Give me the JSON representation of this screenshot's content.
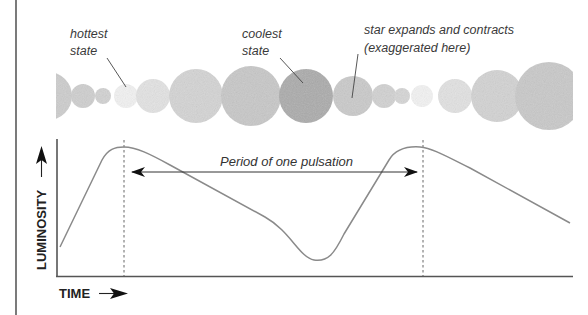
{
  "annotations": {
    "hottest": {
      "line1": "hottest",
      "line2": "state"
    },
    "coolest": {
      "line1": "coolest",
      "line2": "state"
    },
    "expands": {
      "line1": "star expands and contracts",
      "line2": "(exaggerated here)"
    }
  },
  "axes": {
    "y_label": "LUMINOSITY",
    "x_label": "TIME"
  },
  "period_label": "Period of one pulsation",
  "colors": {
    "curve": "#8a8a8a",
    "axis": "#555555",
    "arrow": "#111111",
    "frame": "#222222",
    "star_light": "#e6e6e6",
    "star_mid": "#c9c9c9",
    "star_dark": "#a8a8a8"
  },
  "stars": [
    {
      "cx": 48,
      "cy": 96,
      "r": 24,
      "shade": "#cdcdcd"
    },
    {
      "cx": 83,
      "cy": 96,
      "r": 12,
      "shade": "#cfcfcf"
    },
    {
      "cx": 103,
      "cy": 96,
      "r": 8,
      "shade": "#d2d2d2"
    },
    {
      "cx": 126,
      "cy": 96,
      "r": 12,
      "shade": "#f2f2f2"
    },
    {
      "cx": 153,
      "cy": 96,
      "r": 17,
      "shade": "#e3e3e3"
    },
    {
      "cx": 196,
      "cy": 96,
      "r": 27,
      "shade": "#d4d4d4"
    },
    {
      "cx": 251,
      "cy": 96,
      "r": 30,
      "shade": "#c8c8c8"
    },
    {
      "cx": 306,
      "cy": 96,
      "r": 27,
      "shade": "#ababab"
    },
    {
      "cx": 353,
      "cy": 96,
      "r": 20,
      "shade": "#cacaca"
    },
    {
      "cx": 384,
      "cy": 96,
      "r": 12,
      "shade": "#d2d2d2"
    },
    {
      "cx": 402,
      "cy": 96,
      "r": 8,
      "shade": "#d6d6d6"
    },
    {
      "cx": 422,
      "cy": 96,
      "r": 11,
      "shade": "#f3f3f3"
    },
    {
      "cx": 455,
      "cy": 96,
      "r": 17,
      "shade": "#e2e2e2"
    },
    {
      "cx": 497,
      "cy": 96,
      "r": 26,
      "shade": "#d3d3d3"
    },
    {
      "cx": 549,
      "cy": 96,
      "r": 34,
      "shade": "#c9c9c9"
    }
  ],
  "chart_data": {
    "type": "line",
    "xlabel": "TIME",
    "ylabel": "LUMINOSITY",
    "x_ticks": [],
    "y_ticks": [],
    "grid": false,
    "legend": null,
    "series": [
      {
        "name": "luminosity",
        "points_px": [
          [
            60,
            247
          ],
          [
            100,
            168
          ],
          [
            110,
            152
          ],
          [
            123,
            147
          ],
          [
            140,
            150
          ],
          [
            170,
            165
          ],
          [
            265,
            216
          ],
          [
            290,
            232
          ],
          [
            315,
            258
          ],
          [
            330,
            252
          ],
          [
            345,
            232
          ],
          [
            390,
            160
          ],
          [
            400,
            148
          ],
          [
            423,
            147
          ],
          [
            440,
            150
          ],
          [
            470,
            168
          ],
          [
            570,
            223
          ]
        ]
      }
    ],
    "markers": {
      "peak_1_x": 124,
      "peak_2_x": 423,
      "period_arrow": {
        "from_x": 130,
        "to_x": 418,
        "y": 172,
        "label": "Period of one pulsation"
      }
    }
  }
}
